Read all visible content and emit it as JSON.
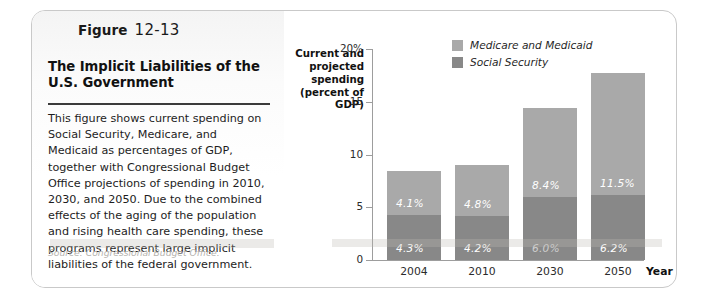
{
  "figure": {
    "label_word": "Figure",
    "number": "12-13",
    "title": "The Implicit Liabilities of the U.S. Government",
    "body": "This figure shows current spending on Social Security, Medicare, and Medicaid as percentages of GDP, together with Congressional Budget Office projections of spending in 2010, 2030, and 2050. Due to the combined effects of the aging of the population and rising health care spending, these programs represent large implicit liabilities of the federal government.",
    "source": "Source: Congressional Budget Office."
  },
  "colors": {
    "medicare_medicaid": "#a9a9a9",
    "social_security": "#888888",
    "axis": "#9d9d9d",
    "card_border": "#c9c9c9",
    "rule": "#3b3b3b"
  },
  "chart_data": {
    "type": "bar",
    "subtype": "stacked",
    "title": "",
    "ylabel": "Current and projected spending (percent of GDP)",
    "xlabel": "Year",
    "categories": [
      "2004",
      "2010",
      "2030",
      "2050"
    ],
    "ylim": [
      0,
      20
    ],
    "yticks": [
      0,
      5,
      10,
      15,
      20
    ],
    "ytick_labels": [
      "0",
      "5",
      "10",
      "15",
      "20%"
    ],
    "grid": false,
    "legend_position": "top-right-inside",
    "series": [
      {
        "name": "Social Security",
        "color": "#888888",
        "values": [
          4.3,
          4.2,
          6.0,
          6.2
        ],
        "labels": [
          "4.3%",
          "4.2%",
          "6.0%",
          "6.2%"
        ]
      },
      {
        "name": "Medicare and Medicaid",
        "color": "#a9a9a9",
        "values": [
          4.1,
          4.8,
          8.4,
          11.5
        ],
        "labels": [
          "4.1%",
          "4.8%",
          "8.4%",
          "11.5%"
        ]
      }
    ],
    "totals": [
      8.4,
      9.0,
      14.4,
      17.7
    ]
  }
}
